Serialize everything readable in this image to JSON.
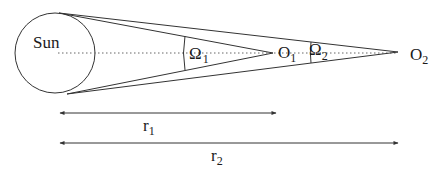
{
  "diagram": {
    "sun_label": "Sun",
    "observer1": {
      "symbol": "O",
      "subscript": "1"
    },
    "observer2": {
      "symbol": "O",
      "subscript": "2"
    },
    "angle1": {
      "symbol": "Ω",
      "subscript": "1"
    },
    "angle2": {
      "symbol": "Ω",
      "subscript": "2"
    },
    "distance1": {
      "symbol": "r",
      "subscript": "1"
    },
    "distance2": {
      "symbol": "r",
      "subscript": "2"
    },
    "colors": {
      "line": "#333333",
      "axis": "#666666",
      "background": "#ffffff"
    }
  }
}
